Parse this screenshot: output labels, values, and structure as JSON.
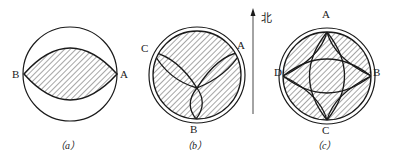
{
  "figure": {
    "colors": {
      "stroke": "#1a1a1a",
      "hatch": "#333333",
      "background": "#ffffff"
    },
    "panels": [
      {
        "id": "a",
        "caption": "（a）",
        "points": {
          "B": "B",
          "A": "A"
        },
        "description": "single circle with hatched lens between points B and A"
      },
      {
        "id": "b",
        "caption": "（b）",
        "points": {
          "C": "C",
          "A": "A",
          "B": "B"
        },
        "description": "double circle, hatched disk with three lens-shaped lobes meeting at center"
      },
      {
        "id": "c",
        "caption": "（c）",
        "points": {
          "A": "A",
          "B": "B",
          "C": "C",
          "D": "D"
        },
        "description": "double circle, hatched disk with four intersecting lens shapes between A-C and D-B"
      }
    ],
    "north_arrow": {
      "label": "北",
      "icon": "north-arrow-icon"
    }
  }
}
